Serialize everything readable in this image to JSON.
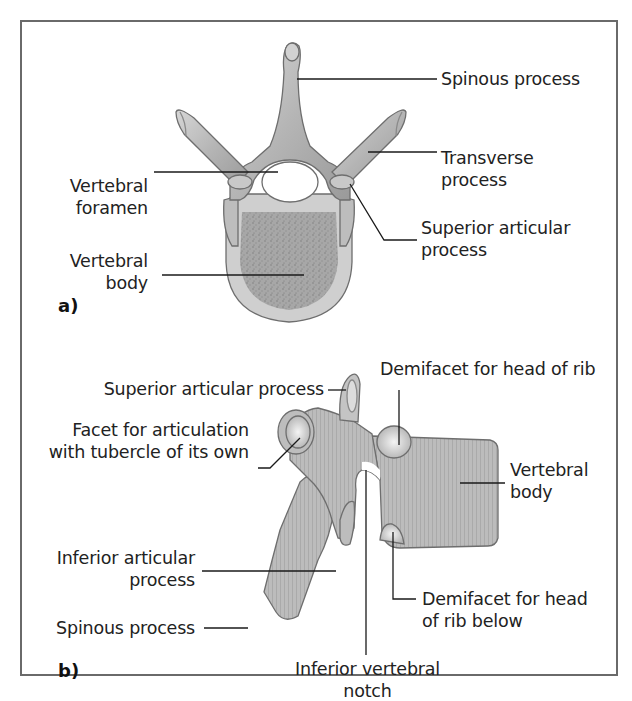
{
  "figure": {
    "panels": [
      {
        "id": "a",
        "tag": "a)",
        "view": "superior view",
        "labels": {
          "spinous_process": "Spinous process",
          "transverse_process_1": "Transverse",
          "transverse_process_2": "process",
          "vertebral_foramen_1": "Vertebral",
          "vertebral_foramen_2": "foramen",
          "superior_articular_1": "Superior articular",
          "superior_articular_2": "process",
          "vertebral_body_1": "Vertebral",
          "vertebral_body_2": "body"
        }
      },
      {
        "id": "b",
        "tag": "b)",
        "view": "lateral view",
        "labels": {
          "superior_articular": "Superior articular process",
          "demifacet_head": "Demifacet for head of rib",
          "facet_tubercle_1": "Facet for articulation",
          "facet_tubercle_2": "with tubercle of its own",
          "vertebral_body_1": "Vertebral",
          "vertebral_body_2": "body",
          "inferior_articular_1": "Inferior articular",
          "inferior_articular_2": "process",
          "spinous_process": "Spinous process",
          "demifacet_below_1": "Demifacet for head",
          "demifacet_below_2": "of rib below",
          "inferior_notch_1": "Inferior vertebral",
          "inferior_notch_2": "notch"
        }
      }
    ],
    "colors": {
      "bone": "#b9b9b9",
      "bone_light": "#d8d8d8",
      "bone_dark": "#8a8a8a",
      "outline": "#6e6e6e",
      "leader_line": "#1a1a1a",
      "frame": "#6a6a6a",
      "text": "#222222"
    }
  }
}
